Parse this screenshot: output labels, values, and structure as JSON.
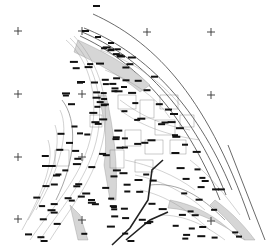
{
  "map": {
    "type": "topographic-survey-plan",
    "background": "#ffffff",
    "line_color": "#444444",
    "label_color": "#111111",
    "grid_crosses": {
      "x": [
        18,
        82,
        147,
        211
      ],
      "y": [
        31,
        94,
        157,
        219
      ],
      "visible": [
        [
          18,
          31
        ],
        [
          82,
          31
        ],
        [
          147,
          31
        ],
        [
          211,
          31
        ],
        [
          18,
          94
        ],
        [
          82,
          94
        ],
        [
          211,
          94
        ],
        [
          18,
          157
        ],
        [
          82,
          157
        ],
        [
          18,
          219
        ],
        [
          82,
          219
        ],
        [
          211,
          225
        ]
      ]
    },
    "label_blocks_count": 160,
    "features": [
      "boundary-arc",
      "road-arc",
      "contour-lines",
      "parcel-lines",
      "hatched-slope",
      "main-road"
    ]
  }
}
